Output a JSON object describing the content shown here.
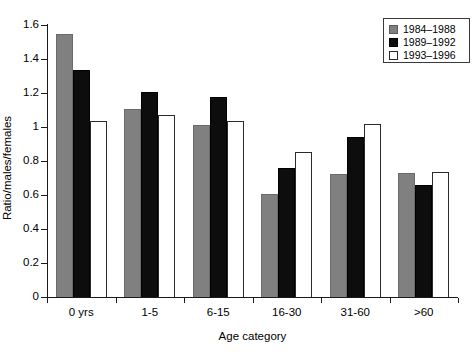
{
  "chart_data": {
    "type": "bar",
    "title": "",
    "subtitle": "",
    "xlabel": "Age category",
    "ylabel": "Ratio/males/females",
    "categories": [
      "0 yrs",
      "1-5",
      "6-15",
      "16-30",
      "31-60",
      ">60"
    ],
    "series": [
      {
        "name": "1984–1988",
        "color": "#808080",
        "values": [
          1.545,
          1.105,
          1.01,
          0.605,
          0.725,
          0.73
        ]
      },
      {
        "name": "1989–1992",
        "color": "#0d0d0d",
        "values": [
          1.335,
          1.205,
          1.175,
          0.76,
          0.94,
          0.655
        ]
      },
      {
        "name": "1993–1996",
        "color": "#ffffff",
        "values": [
          1.035,
          1.07,
          1.035,
          0.85,
          1.015,
          0.735
        ]
      }
    ],
    "ylim": [
      0,
      1.6
    ],
    "ytick_values": [
      0,
      0.2,
      0.4,
      0.6,
      0.8,
      1,
      1.2,
      1.4,
      1.6
    ],
    "ytick_labels": [
      "0",
      "0.2",
      "0.4",
      "0.6",
      "0.8",
      "1",
      "1.2",
      "1.4",
      "1.6"
    ],
    "grid": false,
    "legend_position": "top-right",
    "legend_entries": [
      "1984–1988",
      "1989–1992",
      "1993–1996"
    ]
  }
}
